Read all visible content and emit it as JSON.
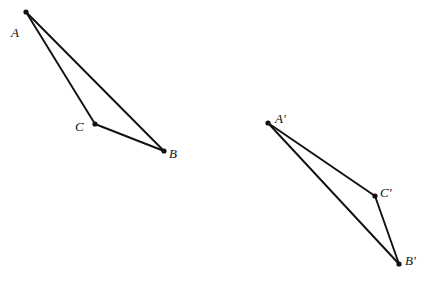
{
  "figure": {
    "background_color": "#ffffff",
    "stroke_color": "#111111",
    "canvas": {
      "width": 433,
      "height": 281
    }
  },
  "shapes": [
    {
      "name": "triangle-abc",
      "vertices": [
        {
          "id": "A",
          "label": "A",
          "x": 26,
          "y": 12,
          "label_x": 11,
          "label_y": 26
        },
        {
          "id": "B",
          "label": "B",
          "x": 164,
          "y": 151,
          "label_x": 169,
          "label_y": 147
        },
        {
          "id": "C",
          "label": "C",
          "x": 95,
          "y": 124,
          "label_x": 75,
          "label_y": 120
        }
      ],
      "edges": [
        {
          "name": "edge-ab",
          "from": "A",
          "to": "B"
        },
        {
          "name": "edge-bc",
          "from": "B",
          "to": "C"
        },
        {
          "name": "edge-ca",
          "from": "C",
          "to": "A"
        }
      ]
    },
    {
      "name": "triangle-a-prime-b-prime-c-prime",
      "vertices": [
        {
          "id": "A'",
          "label": "A'",
          "x": 268,
          "y": 123,
          "label_x": 275,
          "label_y": 112
        },
        {
          "id": "B'",
          "label": "B'",
          "x": 399,
          "y": 264,
          "label_x": 405,
          "label_y": 254
        },
        {
          "id": "C'",
          "label": "C'",
          "x": 375,
          "y": 196,
          "label_x": 380,
          "label_y": 186
        }
      ],
      "edges": [
        {
          "name": "edge-a-prime-b-prime",
          "from": "A'",
          "to": "B'"
        },
        {
          "name": "edge-b-prime-c-prime",
          "from": "B'",
          "to": "C'"
        },
        {
          "name": "edge-c-prime-a-prime",
          "from": "C'",
          "to": "A'"
        }
      ]
    }
  ]
}
